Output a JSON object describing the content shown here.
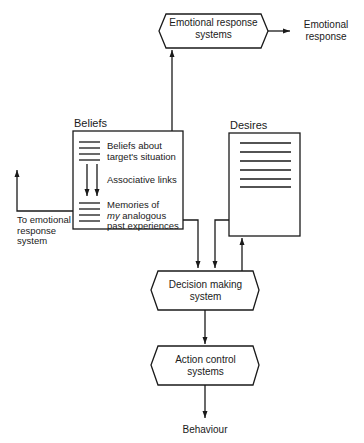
{
  "diagram": {
    "nodes": {
      "emotional_response_systems": {
        "line1": "Emotional response",
        "line2": "systems"
      },
      "emotional_response_output": {
        "line1": "Emotional",
        "line2": "response"
      },
      "beliefs": {
        "title": "Beliefs",
        "item1_line1": "Beliefs about",
        "item1_line2": "target's situation",
        "links_label": "Associative links",
        "item2_line1": "Memories of",
        "item2_line2_italic": "my",
        "item2_line2_rest": " analogous",
        "item2_line3": "past experiences"
      },
      "desires": {
        "title": "Desires"
      },
      "to_emotional": {
        "line1": "To emotional",
        "line2": "response",
        "line3": "system"
      },
      "decision_making": {
        "line1": "Decision making",
        "line2": "system"
      },
      "action_control": {
        "line1": "Action control",
        "line2": "systems"
      },
      "behaviour": {
        "label": "Behaviour"
      }
    },
    "edges": [
      {
        "from": "beliefs",
        "to": "emotional_response_systems"
      },
      {
        "from": "emotional_response_systems",
        "to": "emotional_response_output"
      },
      {
        "from": "beliefs",
        "to": "to_emotional"
      },
      {
        "from": "beliefs",
        "to": "decision_making"
      },
      {
        "from": "desires",
        "to": "decision_making"
      },
      {
        "from": "decision_making",
        "to": "desires"
      },
      {
        "from": "decision_making",
        "to": "action_control"
      },
      {
        "from": "action_control",
        "to": "behaviour"
      }
    ]
  }
}
